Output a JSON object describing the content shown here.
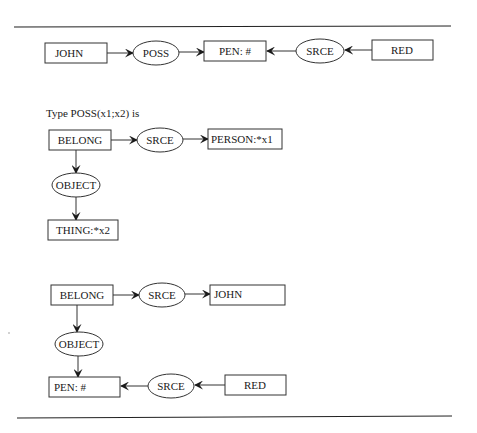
{
  "figure": {
    "caption": "Type POSS(x1;x2) is",
    "graph1": {
      "nodes": {
        "john": "JOHN",
        "poss": "POSS",
        "pen": "PEN: #",
        "srce": "SRCE",
        "red": "RED"
      }
    },
    "graph2": {
      "nodes": {
        "belong": "BELONG",
        "srce": "SRCE",
        "person": "PERSON:*x1",
        "object": "OBJECT",
        "thing": "THING:*x2"
      }
    },
    "graph3": {
      "nodes": {
        "belong": "BELONG",
        "srce": "SRCE",
        "john": "JOHN",
        "object": "OBJECT",
        "pen": "PEN: #",
        "srce2": "SRCE",
        "red": "RED"
      }
    },
    "colors": {
      "line": "#333333",
      "text": "#1a1a1a",
      "background": "#ffffff"
    }
  }
}
